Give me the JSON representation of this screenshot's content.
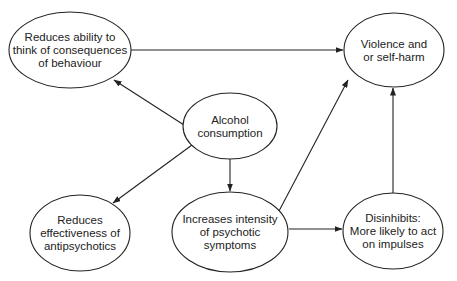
{
  "diagram": {
    "stroke_color": "#222222",
    "background": "#ffffff",
    "nodes": [
      {
        "id": "reduces-ability",
        "cx": 70,
        "cy": 50,
        "rx": 61,
        "ry": 38,
        "lines": [
          "Reduces ability to",
          "think of consequences",
          "of behaviour"
        ]
      },
      {
        "id": "violence",
        "cx": 394,
        "cy": 50,
        "rx": 50,
        "ry": 37,
        "lines": [
          "Violence and",
          "or self-harm"
        ]
      },
      {
        "id": "alcohol",
        "cx": 230,
        "cy": 126,
        "rx": 47,
        "ry": 33,
        "lines": [
          "Alcohol",
          "consumption"
        ]
      },
      {
        "id": "reduces-effectiveness",
        "cx": 80,
        "cy": 233,
        "rx": 50,
        "ry": 38,
        "lines": [
          "Reduces",
          "effectiveness of",
          "antipsychotics"
        ]
      },
      {
        "id": "increases-intensity",
        "cx": 230,
        "cy": 232,
        "rx": 58,
        "ry": 40,
        "lines": [
          "Increases intensity",
          "of psychotic",
          "symptoms"
        ]
      },
      {
        "id": "disinhibits",
        "cx": 393,
        "cy": 231,
        "rx": 50,
        "ry": 38,
        "lines": [
          "Disinhibits:",
          "More likely to act",
          "on impulses"
        ]
      }
    ],
    "edges": [
      {
        "from": "reduces-ability",
        "to": "violence",
        "x1": 131,
        "y1": 50,
        "x2": 343,
        "y2": 50
      },
      {
        "from": "alcohol",
        "to": "reduces-ability",
        "x1": 184,
        "y1": 125,
        "x2": 114,
        "y2": 80
      },
      {
        "from": "alcohol",
        "to": "reduces-effectiveness",
        "x1": 192,
        "y1": 145,
        "x2": 113,
        "y2": 203
      },
      {
        "from": "alcohol",
        "to": "increases-intensity",
        "x1": 230,
        "y1": 159,
        "x2": 230,
        "y2": 191
      },
      {
        "from": "increases-intensity",
        "to": "violence",
        "x1": 279,
        "y1": 211,
        "x2": 348,
        "y2": 80
      },
      {
        "from": "increases-intensity",
        "to": "disinhibits",
        "x1": 289,
        "y1": 229,
        "x2": 342,
        "y2": 229
      },
      {
        "from": "disinhibits",
        "to": "violence",
        "x1": 393,
        "y1": 193,
        "x2": 393,
        "y2": 88
      }
    ]
  }
}
